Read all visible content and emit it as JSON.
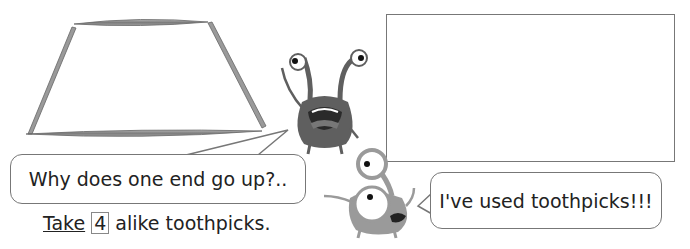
{
  "figure": {
    "trapezoid": {
      "description": "Trapezoid formed by 4 toothpicks",
      "sticks": 4,
      "stick_color": "#8a8a8a"
    },
    "drawing_box": {
      "description": "Empty frame for drawing",
      "border_color": "#777777"
    }
  },
  "characters": [
    {
      "name": "dark-monster",
      "color": "#5f5f5f"
    },
    {
      "name": "light-monster",
      "color": "#9a9a9a"
    }
  ],
  "bubbles": {
    "left": {
      "text": "Why does one end go up?.."
    },
    "right": {
      "text": "I've used toothpicks!!!"
    }
  },
  "caption": {
    "verb": "Take",
    "number": "4",
    "rest": "alike toothpicks."
  }
}
